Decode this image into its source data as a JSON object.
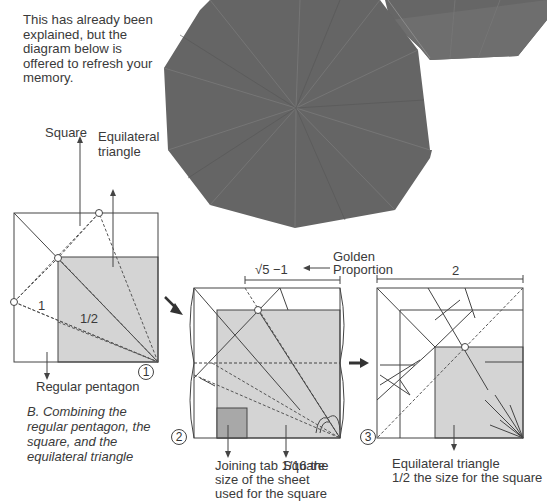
{
  "intro_text": "This has already been explained, but the diagram below is offered to refresh your memory.",
  "caption": "B. Combining the regular pentagon, the square, and the equilateral triangle",
  "photo": {
    "description": "Photograph of folded gray origami decagon model",
    "color": "#6a6a6a"
  },
  "step1": {
    "number": "1",
    "labels": {
      "square": "Square",
      "equilateral_triangle_line1": "Equilateral",
      "equilateral_triangle_line2": "triangle",
      "regular_pentagon": "Regular pentagon",
      "ratio_one": "1",
      "ratio_half": "1/2"
    }
  },
  "step2": {
    "number": "2",
    "labels": {
      "sqrt_label": "√5 −1",
      "golden_line1": "Golden",
      "golden_line2": "Proportion",
      "joining_tab_line1": "Joining tab 1/16 the",
      "joining_tab_line2": "size of the sheet",
      "joining_tab_line3": "used for the square",
      "square": "Square"
    }
  },
  "step3": {
    "number": "3",
    "labels": {
      "width": "2",
      "eq_tri_line1": "Equilateral triangle",
      "eq_tri_line2": "1/2 the size for the square"
    }
  },
  "colors": {
    "shade": "#d4d4d4",
    "tab": "#a8a8a8",
    "line": "#444444",
    "photo_dark": "#5f5f5f"
  }
}
